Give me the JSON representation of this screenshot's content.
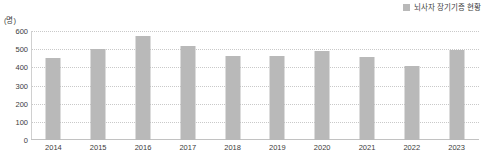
{
  "legend": {
    "swatch_color": "#b9b9b9",
    "entries": [
      {
        "label": "뇌사자 장기기증 현황"
      }
    ]
  },
  "axis": {
    "unit_label": "(명)",
    "y_ticks": [
      "600",
      "500",
      "400",
      "300",
      "200",
      "100",
      "0"
    ]
  },
  "chart_data": {
    "type": "bar",
    "title": "",
    "subtitle": "",
    "xlabel": "",
    "ylabel": "(명)",
    "ylim": [
      0,
      600
    ],
    "grid": true,
    "legend_position": "top-right",
    "bar_color": "#b9b9b9",
    "categories": [
      "2014",
      "2015",
      "2016",
      "2017",
      "2018",
      "2019",
      "2020",
      "2021",
      "2022",
      "2023"
    ],
    "series": [
      {
        "name": "뇌사자 장기기증 현황",
        "values": [
          450,
          500,
          573,
          515,
          465,
          465,
          490,
          455,
          405,
          495
        ]
      }
    ]
  }
}
